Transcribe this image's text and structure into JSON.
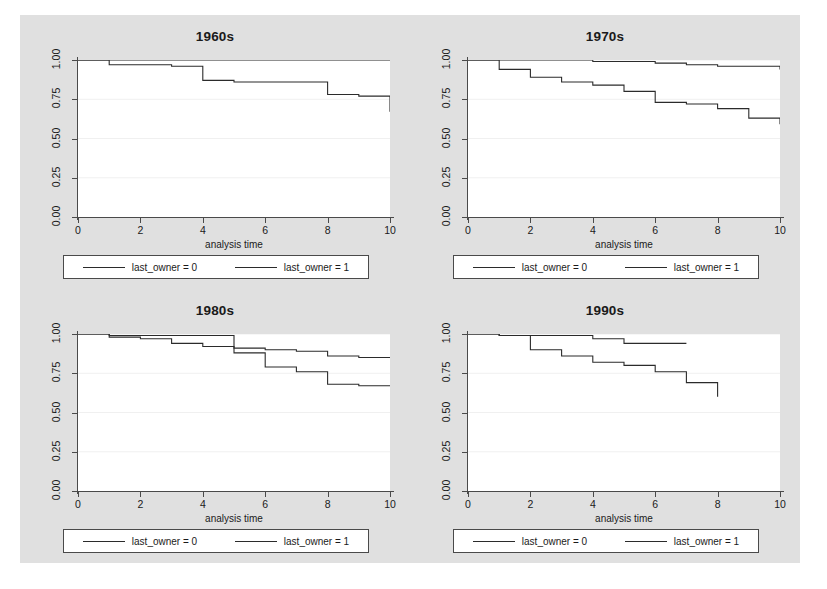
{
  "figure": {
    "background_color": "#e0e0e0",
    "panel_background": "#ffffff",
    "line_color": "#2b2b2b",
    "axis_color": "#4a4a4a",
    "grid_color": "#f0f0f0"
  },
  "axis": {
    "xlabel": "analysis time",
    "ylabel": "",
    "ytick_labels": [
      "0.00",
      "0.25",
      "0.50",
      "0.75",
      "1.00"
    ],
    "ytick_values": [
      0.0,
      0.25,
      0.5,
      0.75,
      1.0
    ],
    "xtick_labels": [
      "0",
      "2",
      "4",
      "6",
      "8",
      "10"
    ],
    "xtick_values": [
      0,
      2,
      4,
      6,
      8,
      10
    ],
    "xlim": [
      0,
      10
    ],
    "ylim": [
      0,
      1
    ]
  },
  "legend": {
    "entries": [
      {
        "label": "last_owner = 0",
        "name": "legend-entry-last-owner-0"
      },
      {
        "label": "last_owner = 1",
        "name": "legend-entry-last-owner-1"
      }
    ]
  },
  "chart_data": {
    "type": "line",
    "xlabel": "analysis time",
    "ylabel": "",
    "xlim": [
      0,
      10
    ],
    "ylim": [
      0,
      1
    ],
    "grid": true,
    "legend_position": "below-panel",
    "panels": [
      {
        "title": "1960s",
        "series": [
          {
            "name": "last_owner = 0",
            "step": "post",
            "x": [
              0,
              1,
              2,
              3,
              4,
              5,
              6,
              7,
              8,
              9,
              10
            ],
            "y": [
              1.0,
              1.0,
              1.0,
              1.0,
              1.0,
              1.0,
              1.0,
              1.0,
              1.0,
              1.0,
              1.0
            ]
          },
          {
            "name": "last_owner = 1",
            "step": "post",
            "x": [
              0,
              1,
              2,
              3,
              4,
              5,
              6,
              7,
              8,
              9,
              10,
              10
            ],
            "y": [
              1.0,
              0.97,
              0.97,
              0.96,
              0.87,
              0.86,
              0.86,
              0.86,
              0.78,
              0.77,
              0.77,
              0.67
            ]
          }
        ]
      },
      {
        "title": "1970s",
        "series": [
          {
            "name": "last_owner = 0",
            "step": "post",
            "x": [
              0,
              1,
              2,
              3,
              4,
              5,
              6,
              7,
              8,
              9,
              10,
              10
            ],
            "y": [
              1.0,
              1.0,
              1.0,
              1.0,
              0.99,
              0.99,
              0.98,
              0.97,
              0.96,
              0.96,
              0.95,
              0.94
            ]
          },
          {
            "name": "last_owner = 1",
            "step": "post",
            "x": [
              0,
              1,
              2,
              3,
              4,
              5,
              6,
              7,
              8,
              9,
              10,
              10
            ],
            "y": [
              1.0,
              0.94,
              0.89,
              0.86,
              0.84,
              0.8,
              0.73,
              0.72,
              0.69,
              0.63,
              0.62,
              0.59
            ]
          }
        ]
      },
      {
        "title": "1980s",
        "series": [
          {
            "name": "last_owner = 0",
            "step": "post",
            "x": [
              0,
              1,
              2,
              3,
              4,
              5,
              6,
              7,
              8,
              9,
              10
            ],
            "y": [
              1.0,
              0.99,
              0.99,
              0.99,
              0.99,
              0.91,
              0.9,
              0.89,
              0.86,
              0.85,
              0.85
            ]
          },
          {
            "name": "last_owner = 1",
            "step": "post",
            "x": [
              0,
              1,
              2,
              3,
              4,
              5,
              6,
              7,
              8,
              9,
              10
            ],
            "y": [
              1.0,
              0.98,
              0.97,
              0.94,
              0.92,
              0.88,
              0.79,
              0.76,
              0.68,
              0.67,
              0.67
            ]
          }
        ]
      },
      {
        "title": "1990s",
        "series": [
          {
            "name": "last_owner = 0",
            "step": "post",
            "x": [
              0,
              1,
              2,
              3,
              4,
              5,
              6,
              7
            ],
            "y": [
              1.0,
              0.99,
              0.99,
              0.99,
              0.97,
              0.94,
              0.94,
              0.94
            ]
          },
          {
            "name": "last_owner = 1",
            "step": "post",
            "x": [
              0,
              1,
              2,
              3,
              4,
              5,
              6,
              7,
              8,
              8
            ],
            "y": [
              1.0,
              0.99,
              0.9,
              0.86,
              0.82,
              0.8,
              0.76,
              0.69,
              0.69,
              0.6
            ]
          }
        ]
      }
    ]
  }
}
